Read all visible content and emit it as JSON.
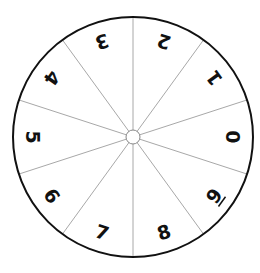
{
  "spinner": {
    "center": {
      "x": 133,
      "y": 137
    },
    "outer_radius": 120,
    "hub_radius": 7,
    "label_radius": 100,
    "segment_count": 10,
    "first_spoke_angle_deg": 18,
    "colors": {
      "rim": "#111111",
      "spokes": "#a8a8a8",
      "hub_stroke": "#888888",
      "background": "#ffffff",
      "digits": "#111111"
    },
    "segments": [
      {
        "label": "0",
        "angle_deg": 0,
        "underline": false
      },
      {
        "label": "1",
        "angle_deg": 36,
        "underline": false
      },
      {
        "label": "2",
        "angle_deg": 72,
        "underline": false
      },
      {
        "label": "3",
        "angle_deg": 108,
        "underline": false
      },
      {
        "label": "4",
        "angle_deg": 144,
        "underline": false
      },
      {
        "label": "5",
        "angle_deg": 180,
        "underline": false
      },
      {
        "label": "6",
        "angle_deg": 216,
        "underline": false
      },
      {
        "label": "7",
        "angle_deg": 252,
        "underline": false
      },
      {
        "label": "8",
        "angle_deg": 288,
        "underline": false
      },
      {
        "label": "9",
        "angle_deg": 324,
        "underline": true
      }
    ]
  }
}
